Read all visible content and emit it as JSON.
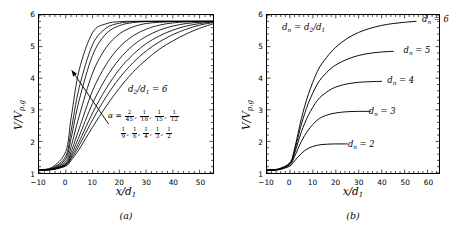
{
  "figure": {
    "panels": [
      {
        "id": "a",
        "caption": "(a)",
        "xlabel": "x/d₁",
        "ylabel": "V/Vₚ,₉",
        "annotation_ratio": "d₂/d₁ = 6",
        "alpha_prefix": "α =",
        "alpha_row1": [
          "2/45",
          "1/18",
          "1/15",
          "1/12"
        ],
        "alpha_row2": [
          "1/9",
          "1/6",
          "1/4",
          "1/3",
          "1/2"
        ],
        "xticks": [
          -10,
          0,
          10,
          20,
          30,
          40,
          50
        ],
        "yticks": [
          1,
          2,
          3,
          4,
          5,
          6
        ]
      },
      {
        "id": "b",
        "caption": "(b)",
        "xlabel": "x/d₁",
        "ylabel": "V/Vₚ,₉",
        "annotation_dn": "dₙ = d₂/d₁",
        "xticks": [
          -10,
          0,
          10,
          20,
          30,
          40,
          50,
          60
        ],
        "yticks": [
          1,
          2,
          3,
          4,
          5,
          6
        ],
        "curve_labels": [
          "dₙ = 2",
          "dₙ = 3",
          "dₙ = 4",
          "dₙ = 5",
          "dₙ = 6"
        ]
      }
    ]
  },
  "chart_data": [
    {
      "type": "line",
      "panel": "a",
      "title": "",
      "xlabel": "x/d_1",
      "ylabel": "V/V_{p,g}",
      "xlim": [
        -10,
        55
      ],
      "ylim": [
        1,
        6
      ],
      "grid": false,
      "legend": "none",
      "annotations": [
        "d_2/d_1 = 6",
        "alpha = 2/45, 1/18, 1/15, 1/12, 1/9, 1/6, 1/4, 1/3, 1/2",
        "arrow indicates direction of increasing alpha"
      ],
      "series": [
        {
          "name": "alpha = 2/45",
          "alpha": 0.04444,
          "plateau": 5.8,
          "growth_rate": 0.055,
          "x": [
            -10,
            -5,
            0,
            2,
            5,
            10,
            15,
            20,
            25,
            30,
            35,
            40,
            45,
            50,
            55
          ],
          "y": [
            1.1,
            1.11,
            1.22,
            1.4,
            1.75,
            2.45,
            3.1,
            3.68,
            4.18,
            4.58,
            4.92,
            5.18,
            5.4,
            5.58,
            5.72
          ]
        },
        {
          "name": "alpha = 1/18",
          "alpha": 0.05556,
          "plateau": 5.8,
          "growth_rate": 0.068,
          "x": [
            -10,
            -5,
            0,
            2,
            5,
            10,
            15,
            20,
            25,
            30,
            35,
            40,
            45,
            50,
            55
          ],
          "y": [
            1.1,
            1.11,
            1.24,
            1.45,
            1.87,
            2.68,
            3.4,
            4.0,
            4.48,
            4.86,
            5.15,
            5.38,
            5.55,
            5.68,
            5.76
          ]
        },
        {
          "name": "alpha = 1/15",
          "alpha": 0.06667,
          "plateau": 5.8,
          "growth_rate": 0.082,
          "x": [
            -10,
            -5,
            0,
            2,
            5,
            10,
            15,
            20,
            25,
            30,
            35,
            40,
            45,
            50,
            55
          ],
          "y": [
            1.1,
            1.11,
            1.26,
            1.5,
            1.99,
            2.9,
            3.66,
            4.28,
            4.74,
            5.09,
            5.34,
            5.52,
            5.65,
            5.73,
            5.78
          ]
        },
        {
          "name": "alpha = 1/12",
          "alpha": 0.08333,
          "plateau": 5.8,
          "growth_rate": 0.102,
          "x": [
            -10,
            -5,
            0,
            2,
            5,
            10,
            15,
            20,
            25,
            30,
            35,
            40,
            45,
            50,
            55
          ],
          "y": [
            1.1,
            1.12,
            1.28,
            1.57,
            2.16,
            3.2,
            4.0,
            4.6,
            5.03,
            5.32,
            5.52,
            5.65,
            5.73,
            5.77,
            5.79
          ]
        },
        {
          "name": "alpha = 1/9",
          "alpha": 0.11111,
          "plateau": 5.8,
          "growth_rate": 0.133,
          "x": [
            -10,
            -5,
            0,
            2,
            5,
            10,
            15,
            20,
            25,
            30,
            35,
            40,
            45,
            50,
            55
          ],
          "y": [
            1.1,
            1.12,
            1.31,
            1.67,
            2.4,
            3.6,
            4.42,
            4.98,
            5.33,
            5.55,
            5.68,
            5.75,
            5.78,
            5.79,
            5.8
          ]
        },
        {
          "name": "alpha = 1/6",
          "alpha": 0.16667,
          "plateau": 5.8,
          "growth_rate": 0.195,
          "x": [
            -10,
            -5,
            0,
            2,
            5,
            10,
            15,
            20,
            25,
            30,
            35,
            40,
            45,
            50,
            55
          ],
          "y": [
            1.1,
            1.13,
            1.37,
            1.84,
            2.8,
            4.16,
            4.96,
            5.4,
            5.62,
            5.73,
            5.77,
            5.79,
            5.8,
            5.8,
            5.8
          ]
        },
        {
          "name": "alpha = 1/4",
          "alpha": 0.25,
          "plateau": 5.8,
          "growth_rate": 0.285,
          "x": [
            -10,
            -5,
            0,
            2,
            5,
            10,
            15,
            20,
            25,
            30,
            35,
            40,
            45,
            50,
            55
          ],
          "y": [
            1.1,
            1.14,
            1.45,
            2.1,
            3.3,
            4.72,
            5.4,
            5.66,
            5.76,
            5.79,
            5.8,
            5.8,
            5.8,
            5.8,
            5.8
          ]
        },
        {
          "name": "alpha = 1/3",
          "alpha": 0.33333,
          "plateau": 5.8,
          "growth_rate": 0.37,
          "x": [
            -10,
            -5,
            0,
            2,
            5,
            10,
            15,
            20,
            25,
            30,
            35,
            40,
            45,
            50,
            55
          ],
          "y": [
            1.1,
            1.16,
            1.53,
            2.34,
            3.7,
            5.06,
            5.58,
            5.74,
            5.79,
            5.8,
            5.8,
            5.8,
            5.8,
            5.8,
            5.8
          ]
        },
        {
          "name": "alpha = 1/2",
          "alpha": 0.5,
          "plateau": 5.8,
          "growth_rate": 0.53,
          "x": [
            -10,
            -5,
            0,
            2,
            5,
            10,
            15,
            20,
            25,
            30,
            35,
            40,
            45,
            50,
            55
          ],
          "y": [
            1.1,
            1.19,
            1.68,
            2.74,
            4.26,
            5.44,
            5.72,
            5.79,
            5.8,
            5.8,
            5.8,
            5.8,
            5.8,
            5.8,
            5.8
          ]
        }
      ]
    },
    {
      "type": "line",
      "panel": "b",
      "title": "",
      "xlabel": "x/d_1",
      "ylabel": "V/V_{p,g}",
      "xlim": [
        -10,
        65
      ],
      "ylim": [
        1,
        6
      ],
      "grid": false,
      "legend": "inline-curve-labels",
      "annotations": [
        "d_n = d_2/d_1"
      ],
      "series": [
        {
          "name": "d_n = 2",
          "dn": 2,
          "plateau": 1.92,
          "label_x": 24,
          "label_y": 1.92,
          "x": [
            -10,
            -5,
            0,
            2,
            5,
            8,
            12,
            16,
            20,
            25
          ],
          "y": [
            1.08,
            1.1,
            1.22,
            1.38,
            1.62,
            1.78,
            1.88,
            1.91,
            1.92,
            1.92
          ]
        },
        {
          "name": "d_n = 3",
          "dn": 3,
          "plateau": 2.95,
          "label_x": 33,
          "label_y": 2.95,
          "x": [
            -10,
            -5,
            0,
            2,
            5,
            8,
            12,
            16,
            20,
            25,
            30,
            35
          ],
          "y": [
            1.09,
            1.11,
            1.26,
            1.52,
            2.0,
            2.36,
            2.68,
            2.83,
            2.9,
            2.94,
            2.95,
            2.95
          ]
        },
        {
          "name": "d_n = 4",
          "dn": 4,
          "plateau": 3.9,
          "label_x": 41,
          "label_y": 3.9,
          "x": [
            -10,
            -5,
            0,
            2,
            5,
            8,
            12,
            16,
            20,
            25,
            30,
            35,
            40
          ],
          "y": [
            1.09,
            1.12,
            1.29,
            1.62,
            2.3,
            2.82,
            3.3,
            3.56,
            3.72,
            3.82,
            3.87,
            3.89,
            3.9
          ]
        },
        {
          "name": "d_n = 5",
          "dn": 5,
          "plateau": 4.85,
          "label_x": 48,
          "label_y": 4.85,
          "x": [
            -10,
            -5,
            0,
            2,
            5,
            8,
            12,
            16,
            20,
            25,
            30,
            35,
            40,
            45
          ],
          "y": [
            1.1,
            1.12,
            1.31,
            1.7,
            2.54,
            3.2,
            3.82,
            4.18,
            4.42,
            4.6,
            4.72,
            4.79,
            4.83,
            4.85
          ]
        },
        {
          "name": "d_n = 6",
          "dn": 6,
          "plateau": 5.8,
          "label_x": 56,
          "label_y": 5.8,
          "x": [
            -10,
            -5,
            0,
            2,
            5,
            8,
            12,
            16,
            20,
            25,
            30,
            35,
            40,
            45,
            50,
            55
          ],
          "y": [
            1.1,
            1.13,
            1.33,
            1.76,
            2.72,
            3.48,
            4.22,
            4.66,
            4.98,
            5.26,
            5.45,
            5.58,
            5.67,
            5.73,
            5.77,
            5.8
          ]
        }
      ]
    }
  ]
}
